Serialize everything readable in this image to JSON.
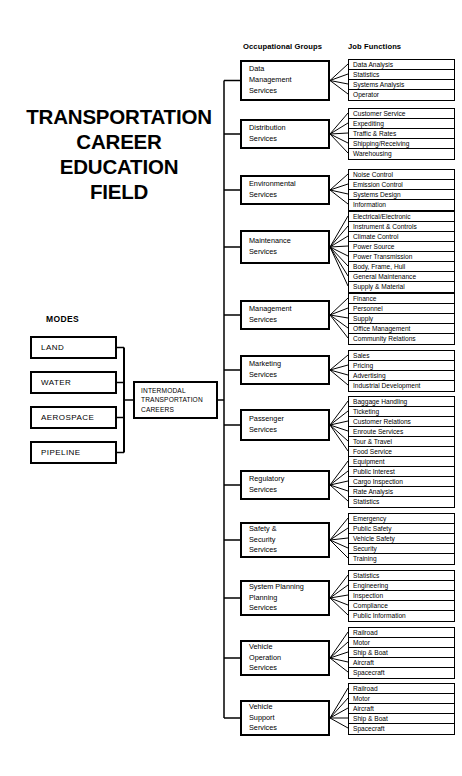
{
  "title": {
    "lines": [
      "TRANSPORTATION",
      "CAREER",
      "EDUCATION",
      "FIELD"
    ]
  },
  "headers": {
    "modes": "MODES",
    "occupational_groups": "Occupational Groups",
    "job_functions": "Job Functions"
  },
  "modes": [
    {
      "label": "LAND"
    },
    {
      "label": "WATER"
    },
    {
      "label": "AEROSPACE"
    },
    {
      "label": "PIPELINE"
    }
  ],
  "hub": {
    "lines": [
      "INTERMODAL",
      "TRANSPORTATION",
      "CAREERS"
    ]
  },
  "groups": [
    {
      "name_lines": [
        "Data",
        "Management",
        "Services"
      ],
      "functions": [
        "Data Analysis",
        "Statistics",
        "Systems Analysis",
        "Operator"
      ]
    },
    {
      "name_lines": [
        "Distribution",
        "Services"
      ],
      "functions": [
        "Customer Service",
        "Expediting",
        "Traffic & Rates",
        "Shipping/Receiving",
        "Warehousing"
      ]
    },
    {
      "name_lines": [
        "Environmental",
        "Services"
      ],
      "functions": [
        "Noise Control",
        "Emission Control",
        "Systems Design",
        "Information"
      ]
    },
    {
      "name_lines": [
        "Maintenance",
        "Services"
      ],
      "functions": [
        "Electrical/Electronic",
        "Instrument & Controls",
        "Climate Control",
        "Power Source",
        "Power Transmission",
        "Body, Frame, Hull",
        "General Maintenance",
        "Supply & Material"
      ]
    },
    {
      "name_lines": [
        "Management",
        "Services"
      ],
      "functions": [
        "Finance",
        "Personnel",
        "Supply",
        "Office Management",
        "Community Relations"
      ]
    },
    {
      "name_lines": [
        "Marketing",
        "Services"
      ],
      "functions": [
        "Sales",
        "Pricing",
        "Advertising",
        "Industrial Development"
      ]
    },
    {
      "name_lines": [
        "Passenger",
        "Services"
      ],
      "functions": [
        "Baggage Handling",
        "Ticketing",
        "Customer Relations",
        "Enroute Services",
        "Tour & Travel",
        "Food Service"
      ]
    },
    {
      "name_lines": [
        "Regulatory",
        "Services"
      ],
      "functions": [
        "Equipment",
        "Public Interest",
        "Cargo Inspection",
        "Rate Analysis",
        "Statistics"
      ]
    },
    {
      "name_lines": [
        "Safety &",
        "Security",
        "Services"
      ],
      "functions": [
        "Emergency",
        "Public Safety",
        "Vehicle Safety",
        "Security",
        "Training"
      ]
    },
    {
      "name_lines": [
        "System Planning",
        "Planning",
        "Services"
      ],
      "functions": [
        "Statistics",
        "Engineering",
        "Inspection",
        "Compliance",
        "Public Information"
      ]
    },
    {
      "name_lines": [
        "Vehicle",
        "Operation",
        "Services"
      ],
      "functions": [
        "Railroad",
        "Motor",
        "Ship & Boat",
        "Aircraft",
        "Spacecraft"
      ]
    },
    {
      "name_lines": [
        "Vehicle",
        "Support",
        "Services"
      ],
      "functions": [
        "Railroad",
        "Motor",
        "Aircraft",
        "Ship & Boat",
        "Spacecraft"
      ]
    }
  ],
  "colors": {
    "ink": "#000000",
    "paper": "#ffffff"
  }
}
